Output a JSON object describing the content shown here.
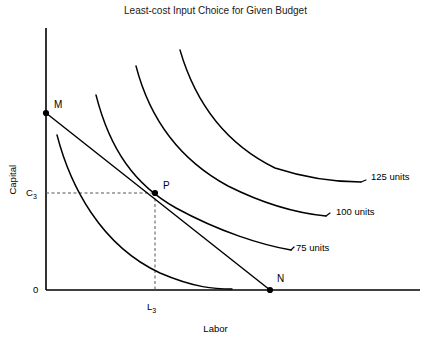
{
  "chart_data": {
    "type": "line",
    "title": "Least-cost Input Choice for Given Budget",
    "xlabel": "Labor",
    "ylabel": "Capital",
    "grid": false,
    "legend_position": "inline-right",
    "axis_ticks": {
      "origin": "0",
      "y_tick": "C",
      "y_tick_sub": "3",
      "x_tick": "L",
      "x_tick_sub": "3"
    },
    "points": [
      {
        "name": "M",
        "label": "M",
        "role": "budget-line-capital-intercept",
        "px": [
          46,
          113
        ]
      },
      {
        "name": "P",
        "label": "P",
        "role": "tangency-least-cost-point",
        "px": [
          155,
          193
        ]
      },
      {
        "name": "N",
        "label": "N",
        "role": "budget-line-labor-intercept",
        "px": [
          270,
          290
        ]
      }
    ],
    "series": [
      {
        "name": "isoquant-unlabeled",
        "label": "",
        "kind": "isoquant",
        "path": "M 57,135 C 70,185 100,245 160,273 C 195,288 215,289 232,289"
      },
      {
        "name": "isoquant-75",
        "label": "75 units",
        "kind": "isoquant",
        "value": 75,
        "units": "units",
        "path": "M 96,95 C 110,150 135,185 176,208 C 220,232 262,245 291,250",
        "label_px": [
          296,
          248
        ]
      },
      {
        "name": "isoquant-100",
        "label": "100 units",
        "kind": "isoquant",
        "value": 100,
        "units": "units",
        "path": "M 136,66 C 150,120 180,160 228,186 C 270,207 305,214 326,216",
        "label_px": [
          336,
          212
        ]
      },
      {
        "name": "isoquant-125",
        "label": "125 units",
        "kind": "isoquant",
        "value": 125,
        "units": "units",
        "path": "M 180,50 C 196,105 228,145 275,168 C 315,181 345,182 361,182",
        "label_px": [
          371,
          177
        ]
      },
      {
        "name": "budget-line",
        "label": "",
        "kind": "isocost",
        "path": "M 46,113 L 270,290"
      }
    ],
    "leader_lines": [
      {
        "for": "isoquant-75",
        "path": "M 291,250 L 294,247"
      },
      {
        "for": "isoquant-100",
        "path": "M 326,216 L 330,213"
      },
      {
        "for": "isoquant-125",
        "path": "M 361,182 L 366,180"
      }
    ],
    "guide_lines": [
      {
        "name": "c3-to-p",
        "path": "M 46,193 L 155,193"
      },
      {
        "name": "p-to-l3",
        "path": "M 155,193 L 155,290"
      }
    ],
    "axes": {
      "y_axis": {
        "x": 46,
        "y_top": 28,
        "y_bottom": 290
      },
      "x_axis": {
        "y": 290,
        "x_left": 46,
        "x_right": 420
      }
    },
    "colors": {
      "ink": "#000000",
      "guide": "#555555",
      "background": "#ffffff"
    }
  }
}
